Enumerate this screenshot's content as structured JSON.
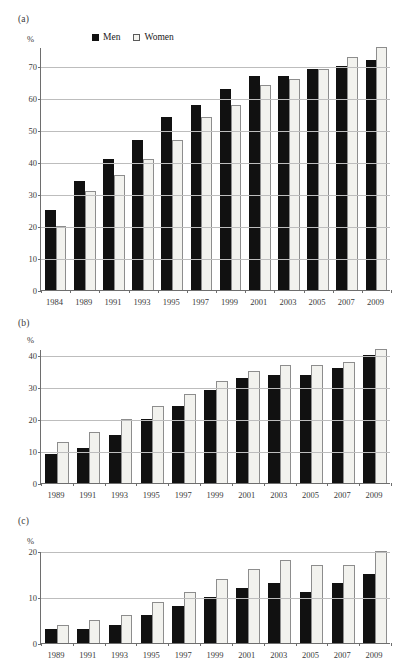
{
  "page": {
    "cut_off_header_text": "",
    "axis_unit_label": "%"
  },
  "legend": {
    "men_label": "Men",
    "women_label": "Women",
    "men_color": "#111111",
    "women_color": "#f2f2ee",
    "women_border_color": "#8d8d8d"
  },
  "panels": [
    {
      "id": "a",
      "label": "(a)",
      "show_legend": true,
      "chart_data": {
        "type": "bar",
        "title": "(a)",
        "xlabel": "",
        "ylabel": "%",
        "ylim": [
          0,
          76
        ],
        "yticks": [
          0,
          10,
          20,
          30,
          40,
          50,
          60,
          70
        ],
        "grid": true,
        "legend_position": "top-center",
        "categories": [
          "1984",
          "1989",
          "1991",
          "1993",
          "1995",
          "1997",
          "1999",
          "2001",
          "2003",
          "2005",
          "2007",
          "2009"
        ],
        "series": [
          {
            "name": "Men",
            "values": [
              25,
              34,
              41,
              47,
              54,
              58,
              63,
              67,
              67,
              69,
              70,
              72
            ]
          },
          {
            "name": "Women",
            "values": [
              20,
              31,
              36,
              41,
              47,
              54,
              58,
              64,
              66,
              69,
              73,
              76
            ]
          }
        ]
      }
    },
    {
      "id": "b",
      "label": "(b)",
      "show_legend": false,
      "chart_data": {
        "type": "bar",
        "title": "(b)",
        "xlabel": "",
        "ylabel": "%",
        "ylim": [
          0,
          42
        ],
        "yticks": [
          0,
          10,
          20,
          30,
          40
        ],
        "grid": true,
        "legend_position": "none",
        "categories": [
          "1989",
          "1991",
          "1993",
          "1995",
          "1997",
          "1999",
          "2001",
          "2003",
          "2005",
          "2007",
          "2009"
        ],
        "series": [
          {
            "name": "Men",
            "values": [
              9,
              11,
              15,
              20,
              24,
              29,
              33,
              34,
              34,
              36,
              40
            ]
          },
          {
            "name": "Women",
            "values": [
              13,
              16,
              20,
              24,
              28,
              32,
              35,
              37,
              37,
              38,
              42
            ]
          }
        ]
      }
    },
    {
      "id": "c",
      "label": "(c)",
      "show_legend": false,
      "chart_data": {
        "type": "bar",
        "title": "(c)",
        "xlabel": "",
        "ylabel": "%",
        "ylim": [
          0,
          20
        ],
        "yticks": [
          0,
          10,
          20
        ],
        "grid": true,
        "legend_position": "none",
        "categories": [
          "1989",
          "1991",
          "1993",
          "1995",
          "1997",
          "1999",
          "2001",
          "2003",
          "2005",
          "2007",
          "2009"
        ],
        "series": [
          {
            "name": "Men",
            "values": [
              3,
              3,
              4,
              6,
              8,
              10,
              12,
              13,
              11,
              13,
              15
            ]
          },
          {
            "name": "Women",
            "values": [
              4,
              5,
              6,
              9,
              11,
              14,
              16,
              18,
              17,
              17,
              20
            ]
          }
        ]
      }
    }
  ]
}
